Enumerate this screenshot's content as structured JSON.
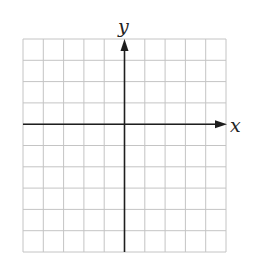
{
  "chart_data": {
    "type": "grid",
    "title": "",
    "xlabel": "x",
    "ylabel": "y",
    "grid": true,
    "columns": 10,
    "rows": 10,
    "x_axis_at_row": 4,
    "y_axis_at_column": 5,
    "tick_labels": [],
    "series": []
  },
  "labels": {
    "x": "x",
    "y": "y"
  },
  "colors": {
    "grid": "#c4c4c4",
    "axis": "#1e1e1e",
    "background": "#ffffff"
  }
}
